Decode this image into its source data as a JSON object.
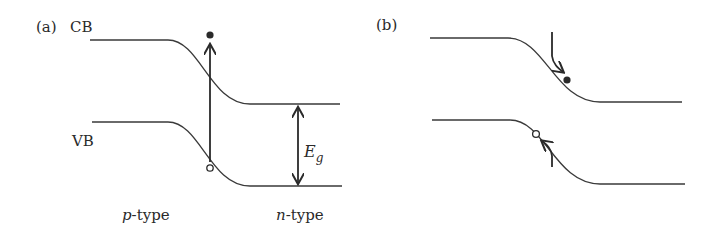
{
  "panel_a": {
    "label": "(a)",
    "cb_label": "CB",
    "vb_label": "VB",
    "gap_label_main": "E",
    "gap_label_sub": "g",
    "left_region_italic": "p",
    "left_region_rest": "-type",
    "right_region_italic": "n",
    "right_region_rest": "-type",
    "description": "Band diagram of p-n junction; vertical arrow shows photon excitation of electron from VB to CB leaving a hole"
  },
  "panel_b": {
    "label": "(b)",
    "description": "Electron drifts down the CB slope toward n-side; hole drifts up the VB slope toward p-side"
  },
  "colors": {
    "line": "#3a3a3a",
    "text": "#2a2a2a",
    "background": "#ffffff"
  }
}
